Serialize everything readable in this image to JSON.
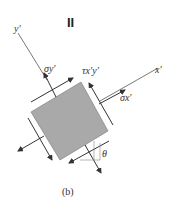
{
  "diagram": {
    "header_mark": "II",
    "caption": "(b)",
    "axes": {
      "x_prime": "x′",
      "y_prime": "y′"
    },
    "labels": {
      "sigma_y": "σy′",
      "tau_xy": "τx′y′",
      "sigma_x": "σx′",
      "theta": "θ"
    },
    "colors": {
      "element_fill": "#a9a9a9",
      "line": "#333333"
    }
  }
}
